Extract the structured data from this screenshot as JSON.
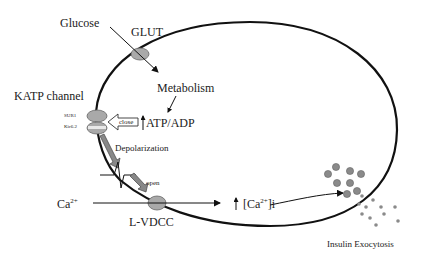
{
  "diagram": {
    "labels": {
      "glucose": "Glucose",
      "glut": "GLUT",
      "metabolism": "Metabolism",
      "katp_channel": "KATP channel",
      "sur1": "SUR1",
      "kir62": "Kir6.2",
      "close": "close",
      "atp_adp": "ATP/ADP",
      "depolarization": "Depolarization",
      "open": "open",
      "calcium_ext": "Ca",
      "calcium_ext_sup": "2+",
      "lvdcc": "L-VDCC",
      "calcium_int_pre": "[Ca",
      "calcium_int_sup": "2+",
      "calcium_int_post": "]i",
      "insulin_exocytosis": "Insulin Exocytosis"
    },
    "colors": {
      "membrane": "#111111",
      "channel_fill": "#a9a9a9",
      "granule_fill": "#8a8a8a",
      "arrow": "#111111",
      "text": "#222222"
    },
    "flow": [
      "Glucose enters via GLUT",
      "Metabolism",
      "ATP/ADP increases",
      "KATP channel closes",
      "Depolarization",
      "L-VDCC opens",
      "Ca2+ influx increases [Ca2+]i",
      "Insulin exocytosis"
    ]
  }
}
